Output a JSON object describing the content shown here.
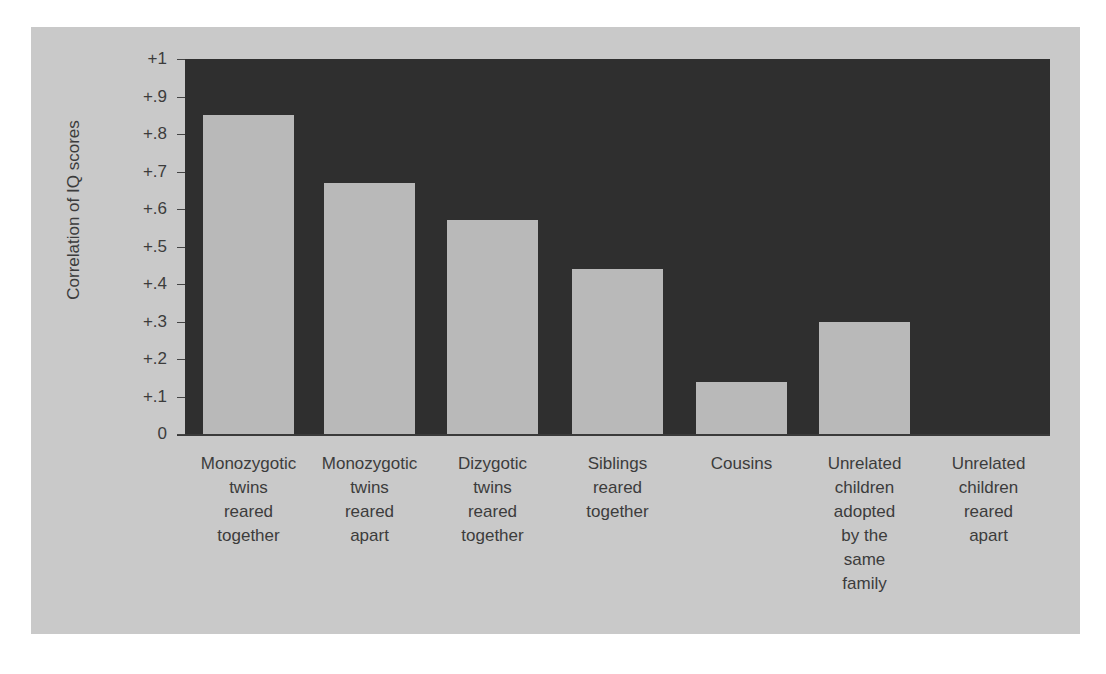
{
  "chart_data": {
    "type": "bar",
    "title": "",
    "xlabel": "",
    "ylabel": "Correlation of IQ scores",
    "ylim": [
      0,
      1
    ],
    "yticks": [
      "0",
      "+.1",
      "+.2",
      "+.3",
      "+.4",
      "+.5",
      "+.6",
      "+.7",
      "+.8",
      "+.9",
      "+1"
    ],
    "grid": false,
    "legend": null,
    "categories": [
      "Monozygotic twins reared together",
      "Monozygotic twins reared apart",
      "Dizygotic twins reared together",
      "Siblings reared together",
      "Cousins",
      "Unrelated children adopted by the same family",
      "Unrelated children reared apart"
    ],
    "category_labels_wrapped": [
      "Monozygotic\ntwins\nreared\ntogether",
      "Monozygotic\ntwins\nreared\napart",
      "Dizygotic\ntwins\nreared\ntogether",
      "Siblings\nreared\ntogether",
      "Cousins",
      "Unrelated\nchildren\nadopted\nby the\nsame\nfamily",
      "Unrelated\nchildren\nreared\napart"
    ],
    "values": [
      0.85,
      0.67,
      0.57,
      0.44,
      0.14,
      0.3,
      0.0
    ],
    "colors": {
      "panel": "#c9c9c9",
      "plot_background": "#2f2f2f",
      "bar": "#b9b9b9",
      "text": "#3c3c3c"
    }
  }
}
